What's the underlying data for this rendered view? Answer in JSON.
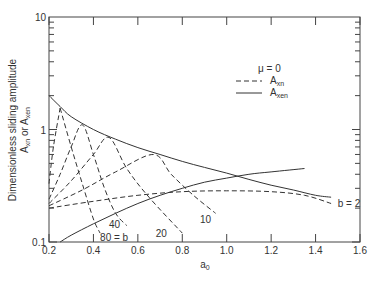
{
  "chart_data": {
    "type": "line",
    "title": "",
    "xlabel": "a0",
    "ylabel": "Dimensionless sliding amplitude A_xn or A_xen",
    "ylabel_line1": "Dimensionless sliding amplitude",
    "ylabel_line2": "A_xn or A_xen",
    "xlim": [
      0.2,
      1.6
    ],
    "ylim": [
      0.1,
      10
    ],
    "yscale": "log",
    "x_ticks": [
      "0.2",
      "0.4",
      "0.6",
      "0.8",
      "1.0",
      "1.2",
      "1.4",
      "1.6"
    ],
    "y_ticks": [
      "0.1",
      "1",
      "10"
    ],
    "grid": false,
    "annotation_mu": "μ = 0",
    "legend": [
      {
        "label": "A_xn",
        "style": "dashed"
      },
      {
        "label": "A_xen",
        "style": "solid"
      }
    ],
    "series": [
      {
        "name": "A_xen upper",
        "style": "solid",
        "x": [
          0.2,
          0.25,
          0.3,
          0.4,
          0.5,
          0.6,
          0.7,
          0.8,
          0.9,
          1.0,
          1.1,
          1.2,
          1.3,
          1.4,
          1.47
        ],
        "y": [
          2.0,
          1.6,
          1.3,
          1.0,
          0.82,
          0.69,
          0.6,
          0.52,
          0.46,
          0.41,
          0.36,
          0.32,
          0.29,
          0.26,
          0.25
        ]
      },
      {
        "name": "A_xen lower",
        "style": "solid",
        "x": [
          0.25,
          0.3,
          0.4,
          0.5,
          0.6,
          0.7,
          0.8,
          0.9,
          1.0,
          1.1,
          1.2,
          1.35
        ],
        "y": [
          0.1,
          0.115,
          0.145,
          0.18,
          0.22,
          0.26,
          0.3,
          0.34,
          0.37,
          0.4,
          0.42,
          0.45
        ]
      },
      {
        "name": "A_xn b=80 rise",
        "style": "dashed",
        "x": [
          0.2,
          0.22,
          0.25
        ],
        "y": [
          0.33,
          0.7,
          1.55
        ]
      },
      {
        "name": "A_xn b=80 fall",
        "style": "dashed",
        "x": [
          0.25,
          0.3,
          0.35,
          0.4,
          0.43
        ],
        "y": [
          1.55,
          0.7,
          0.33,
          0.16,
          0.12
        ]
      },
      {
        "name": "A_xn b=40",
        "style": "dashed",
        "x": [
          0.2,
          0.25,
          0.3,
          0.35,
          0.4,
          0.45,
          0.5,
          0.55
        ],
        "y": [
          0.24,
          0.4,
          0.7,
          1.1,
          0.6,
          0.3,
          0.18,
          0.14
        ]
      },
      {
        "name": "A_xn b=20",
        "style": "dashed",
        "x": [
          0.2,
          0.3,
          0.4,
          0.47,
          0.55,
          0.65,
          0.8
        ],
        "y": [
          0.22,
          0.35,
          0.6,
          0.85,
          0.45,
          0.25,
          0.12
        ]
      },
      {
        "name": "A_xn b=10",
        "style": "dashed",
        "x": [
          0.2,
          0.35,
          0.5,
          0.67,
          0.75,
          0.85,
          0.95
        ],
        "y": [
          0.21,
          0.29,
          0.42,
          0.6,
          0.4,
          0.26,
          0.18
        ]
      },
      {
        "name": "A_xn b=2",
        "style": "dashed",
        "x": [
          0.2,
          0.4,
          0.6,
          0.8,
          1.0,
          1.2,
          1.35,
          1.47
        ],
        "y": [
          0.2,
          0.23,
          0.26,
          0.28,
          0.285,
          0.28,
          0.26,
          0.22
        ]
      }
    ],
    "curve_labels": [
      {
        "text": "80 = b",
        "x": 0.43,
        "y": 0.11
      },
      {
        "text": "40",
        "x": 0.47,
        "y": 0.145
      },
      {
        "text": "20",
        "x": 0.68,
        "y": 0.12
      },
      {
        "text": "10",
        "x": 0.88,
        "y": 0.16
      },
      {
        "text": "b = 2",
        "x": 1.5,
        "y": 0.22
      }
    ]
  }
}
